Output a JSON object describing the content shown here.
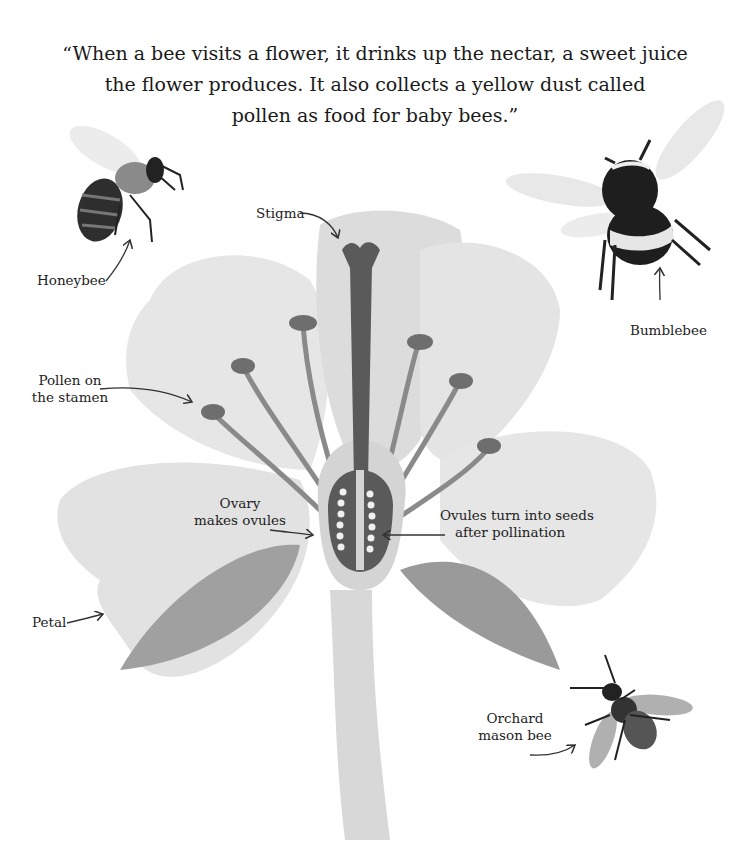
{
  "quote": {
    "line1": "“When a bee visits a flower, it drinks up the nectar, a sweet juice",
    "line2": "the flower produces. It also collects a yellow dust called",
    "line3": "pollen as food for baby bees.”"
  },
  "labels": {
    "stigma": "Stigma",
    "honeybee": "Honeybee",
    "bumblebee": "Bumblebee",
    "pollen_line1": "Pollen on",
    "pollen_line2": "the stamen",
    "ovary_line1": "Ovary",
    "ovary_line2": "makes ovules",
    "ovules_line1": "Ovules turn into seeds",
    "ovules_line2": "after pollination",
    "petal": "Petal",
    "orchard_line1": "Orchard",
    "orchard_line2": "mason bee"
  },
  "colors": {
    "petal": "#e4e4e4",
    "petal_shade": "#d2d2d2",
    "stamen": "#8c8c8c",
    "pistil_dark": "#5a5a5a",
    "leaf": "#9a9a9a",
    "bee_dark": "#2a2a2a"
  }
}
